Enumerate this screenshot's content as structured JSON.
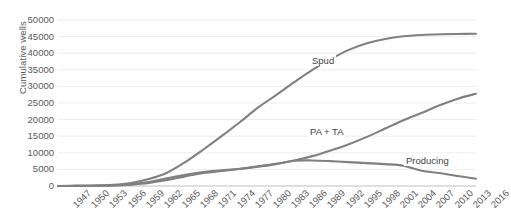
{
  "chart_data": {
    "type": "line",
    "title": "",
    "subtitle": "",
    "xlabel": "",
    "ylabel": "Cumulative wells",
    "ylim": [
      0,
      50000
    ],
    "y_ticks": [
      0,
      5000,
      10000,
      15000,
      20000,
      25000,
      30000,
      35000,
      40000,
      45000,
      50000
    ],
    "grid": "horizontal",
    "legend_position": "inline-annotations",
    "x": [
      1947,
      1950,
      1953,
      1956,
      1959,
      1962,
      1965,
      1968,
      1971,
      1974,
      1977,
      1980,
      1983,
      1986,
      1989,
      1992,
      1995,
      1998,
      2001,
      2004,
      2007,
      2010,
      2013,
      2016
    ],
    "tick_labels": [
      "1947",
      "1950",
      "1953",
      "1956",
      "1959",
      "1962",
      "1965",
      "1968",
      "1971",
      "1974",
      "1977",
      "1980",
      "1983",
      "1986",
      "1989",
      "1992",
      "1995",
      "1998",
      "2001",
      "2004",
      "2007",
      "2010",
      "2013",
      "2016"
    ],
    "series": [
      {
        "name": "Spud",
        "color": "#808080",
        "values": [
          0,
          60,
          150,
          350,
          900,
          2100,
          4000,
          7200,
          11000,
          15000,
          19200,
          23600,
          27400,
          31300,
          35000,
          38200,
          41000,
          43000,
          44300,
          45100,
          45500,
          45700,
          45800,
          45850
        ]
      },
      {
        "name": "PA + TA",
        "color": "#808080",
        "values": [
          0,
          30,
          80,
          200,
          500,
          1200,
          2300,
          3400,
          4200,
          4700,
          5200,
          5900,
          6700,
          7700,
          9000,
          10700,
          12600,
          14800,
          17300,
          19800,
          22000,
          24300,
          26300,
          27800
        ]
      },
      {
        "name": "Producing",
        "color": "#808080",
        "values": [
          0,
          30,
          70,
          150,
          400,
          900,
          1800,
          2900,
          3900,
          4500,
          5100,
          5800,
          6600,
          7600,
          7700,
          7500,
          7200,
          6900,
          6600,
          6100,
          4600,
          3900,
          3000,
          2200
        ]
      }
    ],
    "annotations": [
      {
        "name": "Spud",
        "label": "Spud"
      },
      {
        "name": "PA + TA",
        "label": "PA + TA"
      },
      {
        "name": "Producing",
        "label": "Producing"
      }
    ]
  }
}
